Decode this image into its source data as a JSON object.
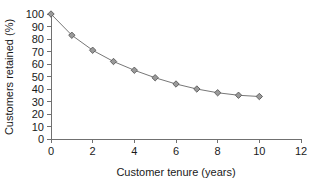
{
  "chart_data": {
    "type": "line",
    "title": "",
    "xlabel": "Customer tenure (years)",
    "ylabel": "Customers retained (%)",
    "x": [
      0,
      1,
      2,
      3,
      4,
      5,
      6,
      7,
      8,
      9,
      10
    ],
    "values": [
      100,
      83,
      71,
      62,
      55,
      49,
      44,
      40,
      37,
      35,
      34
    ],
    "series": [
      {
        "name": "Customers retained",
        "values": [
          100,
          83,
          71,
          62,
          55,
          49,
          44,
          40,
          37,
          35,
          34
        ]
      }
    ],
    "xlim": [
      0,
      12
    ],
    "ylim": [
      0,
      100
    ],
    "xticks": [
      0,
      2,
      4,
      6,
      8,
      10,
      12
    ],
    "xtick_labels": [
      "0",
      "2",
      "4",
      "6",
      "8",
      "10",
      "12"
    ],
    "yticks": [
      0,
      10,
      20,
      30,
      40,
      50,
      60,
      70,
      80,
      90,
      100
    ],
    "ytick_labels": [
      "0",
      "10",
      "20",
      "30",
      "40",
      "50",
      "60",
      "70",
      "80",
      "90",
      "100"
    ],
    "grid": false,
    "legend": false,
    "legend_position": "none",
    "marker": "diamond",
    "line_color": "#777777",
    "marker_fill": "#9a9a9a",
    "marker_stroke": "#5a5a5a",
    "axis_color": "#707070",
    "text_color": "#1a1a1a",
    "background": "#ffffff"
  }
}
